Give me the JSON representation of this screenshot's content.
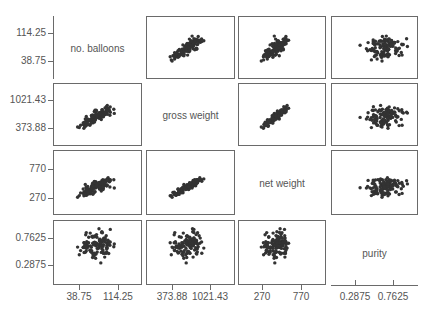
{
  "chart_data": {
    "type": "scatter",
    "title": "",
    "layout": "scatterplot-matrix",
    "variables": [
      "no. balloons",
      "gross weight",
      "net weight",
      "purity"
    ],
    "ticks": {
      "no. balloons": [
        "38.75",
        "114.25"
      ],
      "gross weight": [
        "373.88",
        "1021.43"
      ],
      "net weight": [
        "270",
        "770"
      ],
      "purity": [
        "0.2875",
        "0.7625"
      ]
    },
    "grid": false,
    "legend": "none",
    "correlations_visual": {
      "no. balloons~gross weight": "strong positive",
      "no. balloons~net weight": "strong positive",
      "gross weight~net weight": "very strong positive",
      "purity~others": "no clear relationship"
    }
  },
  "diagonal_labels": [
    "no. balloons",
    "gross weight",
    "net weight",
    "purity"
  ],
  "y_ticks": [
    {
      "hi": "114.25",
      "lo": "38.75"
    },
    {
      "hi": "1021.43",
      "lo": "373.88"
    },
    {
      "hi": "770",
      "lo": "270"
    },
    {
      "hi": "0.7625",
      "lo": "0.2875"
    }
  ],
  "x_ticks": [
    {
      "lo": "38.75",
      "hi": "114.25"
    },
    {
      "lo": "373.88",
      "hi": "1021.43"
    },
    {
      "lo": "270",
      "hi": "770"
    },
    {
      "lo": "0.2875",
      "hi": "0.7625"
    }
  ]
}
